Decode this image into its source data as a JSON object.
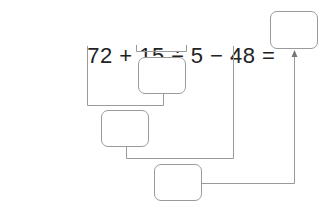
{
  "expression": {
    "tokens": [
      "72",
      "+",
      "15",
      "÷",
      "5",
      "−",
      "48",
      "="
    ],
    "text": "72 + 15 ÷ 5 − 48 ="
  },
  "boxes": [
    {
      "id": "answer",
      "label": ""
    },
    {
      "id": "step1",
      "label": ""
    },
    {
      "id": "step2",
      "label": ""
    },
    {
      "id": "step3",
      "label": ""
    }
  ],
  "colors": {
    "line": "#9a9a9a",
    "text": "#222222"
  }
}
